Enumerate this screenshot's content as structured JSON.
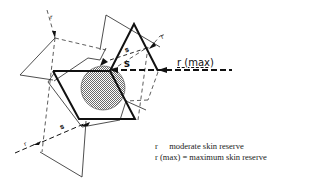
{
  "diagram": {
    "title": "",
    "labels": {
      "s_main": "s",
      "s_upper": "s",
      "s_lower": "s",
      "r_upper_right": "r",
      "r_upper_left": "r",
      "r_lower_left": "r",
      "r_max": "r (max)"
    },
    "colors": {
      "stroke": "#111111",
      "hatch_fill": "#9a9a9a",
      "background": "#ffffff"
    }
  },
  "legend": {
    "items": [
      {
        "key": "r",
        "separator": "",
        "description": "moderate skin reserve"
      },
      {
        "key": "r (max)",
        "separator": "=",
        "description": "maximum skin reserve"
      }
    ]
  }
}
